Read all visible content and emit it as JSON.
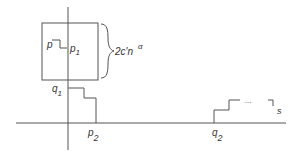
{
  "diagram": {
    "labels": {
      "p": "p",
      "p1_base": "p",
      "p1_sub": "1",
      "q1_base": "q",
      "q1_sub": "1",
      "p2_base": "p",
      "p2_sub": "2",
      "q2_base": "q",
      "q2_sub": "2",
      "s": "s",
      "dots": "...",
      "brace_label": "2c'n",
      "brace_exp": "α"
    },
    "colors": {
      "line": "#555555",
      "text": "#333333"
    }
  }
}
